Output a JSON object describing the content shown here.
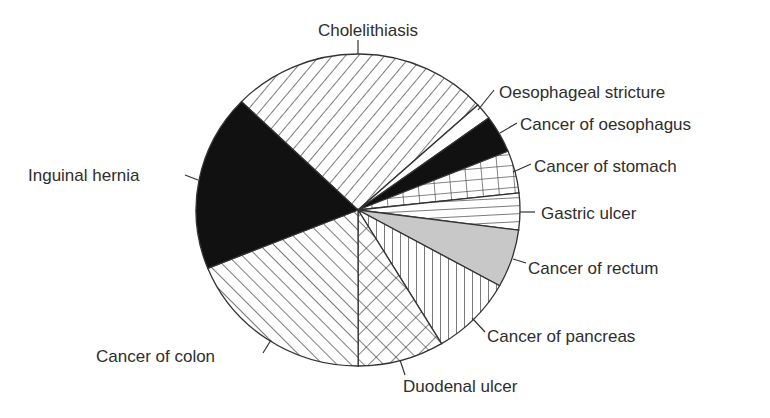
{
  "chart_data": {
    "type": "pie",
    "title": "",
    "start_angle_deg": 314,
    "direction": "clockwise",
    "unit": "percent (estimated from slice angles)",
    "slices": [
      {
        "label": "Cholelithiasis",
        "value": 26.0,
        "pattern": "diag-right",
        "label_x": 368,
        "label_y": 36,
        "anchor": "middle",
        "leader": [
          [
            358,
            40
          ],
          [
            358,
            54
          ]
        ]
      },
      {
        "label": "Oesophageal stricture",
        "value": 1.7,
        "pattern": "white",
        "label_x": 499,
        "label_y": 98,
        "anchor": "start",
        "leader": [
          [
            494,
            90
          ],
          [
            478,
            110
          ]
        ]
      },
      {
        "label": "Cancer of oesophagus",
        "value": 3.9,
        "pattern": "black",
        "label_x": 520,
        "label_y": 130,
        "anchor": "start",
        "leader": [
          [
            517,
            123
          ],
          [
            500,
            133
          ]
        ]
      },
      {
        "label": "Cancer of stomach",
        "value": 4.4,
        "pattern": "grid",
        "label_x": 534,
        "label_y": 172,
        "anchor": "start",
        "leader": [
          [
            531,
            164
          ],
          [
            513,
            172
          ]
        ]
      },
      {
        "label": "Gastric ulcer",
        "value": 3.8,
        "pattern": "horizontal",
        "label_x": 541,
        "label_y": 219,
        "anchor": "start",
        "leader": [
          [
            535,
            212
          ],
          [
            520,
            212
          ]
        ]
      },
      {
        "label": "Cancer of rectum",
        "value": 6.0,
        "pattern": "gray",
        "label_x": 528,
        "label_y": 274,
        "anchor": "start",
        "leader": [
          [
            526,
            263
          ],
          [
            513,
            259
          ]
        ]
      },
      {
        "label": "Cancer of pancreas",
        "value": 8.3,
        "pattern": "vertical",
        "label_x": 487,
        "label_y": 342,
        "anchor": "start",
        "leader": [
          [
            485,
            332
          ],
          [
            472,
            318
          ]
        ]
      },
      {
        "label": "Duodenal ulcer",
        "value": 8.6,
        "pattern": "crosshatch",
        "label_x": 403,
        "label_y": 392,
        "anchor": "start",
        "leader": [
          [
            405,
            375
          ],
          [
            400,
            360
          ]
        ]
      },
      {
        "label": "Cancer of colon",
        "value": 18.9,
        "pattern": "diag-left",
        "label_x": 96,
        "label_y": 362,
        "anchor": "start",
        "leader": [
          [
            263,
            353
          ],
          [
            271,
            340
          ]
        ]
      },
      {
        "label": "Inguinal hernia",
        "value": 18.3,
        "pattern": "black",
        "label_x": 28,
        "label_y": 181,
        "anchor": "start",
        "leader": [
          [
            185,
            175
          ],
          [
            198,
            180
          ]
        ]
      }
    ],
    "center": [
      358,
      210
    ],
    "radius_x": 162,
    "radius_y": 156,
    "legend": "none (direct labels with leader lines)",
    "colors": {
      "outline": "#333333",
      "fill_black": "#111111",
      "fill_gray": "#c8c8c8",
      "text": "#2e2e2e"
    }
  }
}
